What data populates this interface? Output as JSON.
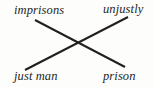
{
  "figure": {
    "kind": "chiasmus-cross-diagram",
    "background_color": "#fdfdfc",
    "ink_color": "#231f1e",
    "terms": {
      "top_left": "imprisons",
      "top_right": "unjustly",
      "bottom_left": "just man",
      "bottom_right": "prison"
    },
    "connectors": [
      {
        "name": "imprisons-to-prison",
        "from": "top_left",
        "to": "bottom_right",
        "x1": 35,
        "y1": 20,
        "x2": 125,
        "y2": 67
      },
      {
        "name": "just-man-to-unjustly",
        "from": "bottom_left",
        "to": "top_right",
        "x1": 25,
        "y1": 70,
        "x2": 128,
        "y2": 17
      }
    ],
    "intersection": {
      "x": 76,
      "y": 44
    },
    "stroke_width": 2
  }
}
